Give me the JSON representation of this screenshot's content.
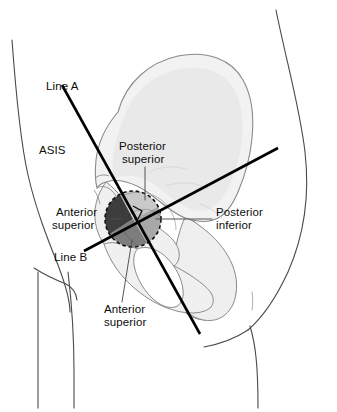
{
  "figure": {
    "colors": {
      "background": "#ffffff",
      "skin_outline": "#4a4a4a",
      "bone_fill": "#f2f2f2",
      "bone_outline": "#8a8a8a",
      "bone_shadow": "#e4e4e4",
      "line_color": "#000000",
      "leader_color": "#555555",
      "quadrant_anterior_superior": "#3d3d3d",
      "quadrant_posterior_superior": "#c9c9c9",
      "quadrant_posterior_inferior": "#a8a8a8",
      "quadrant_anterior_inferior": "#7d7d7d",
      "circle_dash": "#111111",
      "text": "#0d0d0d"
    },
    "circle": {
      "cx": 133,
      "cy": 219,
      "r": 28
    },
    "lines": [
      {
        "id": "line-a",
        "label": "Line A",
        "x1": 62,
        "y1": 85,
        "x2": 200,
        "y2": 334
      },
      {
        "id": "line-b",
        "label": "Line B",
        "x1": 84,
        "y1": 251,
        "x2": 278,
        "y2": 148
      }
    ]
  },
  "labels": {
    "line_a": "Line A",
    "asis": "ASIS",
    "posterior_superior": "Posterior\nsuperior",
    "posterior_superior_l1": "Posterior",
    "posterior_superior_l2": "superior",
    "anterior_superior_left_l1": "Anterior",
    "anterior_superior_left_l2": "superior",
    "posterior_inferior_l1": "Posterior",
    "posterior_inferior_l2": "inferior",
    "line_b": "Line B",
    "anterior_superior_bottom_l1": "Anterior",
    "anterior_superior_bottom_l2": "superior"
  }
}
